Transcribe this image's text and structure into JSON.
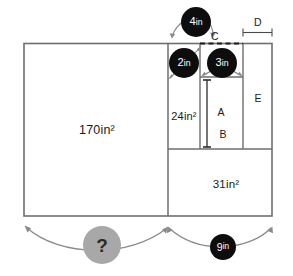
{
  "diagram": {
    "kind": "composite-rectangle-area-puzzle",
    "outer_rect": {
      "x": 24,
      "y": 43,
      "width": 248,
      "height": 173
    },
    "regions": [
      {
        "name": "left-region",
        "label": "170in²",
        "area_value": 170,
        "unit": "in²",
        "cx": 97,
        "cy": 130
      },
      {
        "name": "upper-middle-region",
        "label": "24in²",
        "area_value": 24,
        "unit": "in²",
        "cx": 184,
        "cy": 116
      },
      {
        "name": "lower-right-region",
        "label": "31in²",
        "area_value": 31,
        "unit": "in²",
        "cx": 226,
        "cy": 184
      },
      {
        "name": "segment-a",
        "label": "A",
        "cx": 221,
        "cy": 112
      },
      {
        "name": "segment-b",
        "label": "B",
        "cx": 223,
        "cy": 134
      },
      {
        "name": "segment-e",
        "label": "E",
        "cx": 258,
        "cy": 98
      }
    ],
    "dimension_labels": [
      {
        "name": "label-c",
        "label": "C",
        "cx": 215,
        "cy": 36
      },
      {
        "name": "label-d",
        "label": "D",
        "cx": 258,
        "cy": 22
      }
    ],
    "badges": [
      {
        "name": "badge-4in",
        "text_num": "4",
        "text_unit": "in",
        "color": "#0d0d0d",
        "cx": 196,
        "cy": 22,
        "size": "md"
      },
      {
        "name": "badge-2in",
        "text_num": "2",
        "text_unit": "in",
        "color": "#0d0d0d",
        "cx": 184,
        "cy": 63,
        "size": "md"
      },
      {
        "name": "badge-3in",
        "text_num": "3",
        "text_unit": "in",
        "color": "#0d0d0d",
        "cx": 222,
        "cy": 63,
        "size": "md"
      },
      {
        "name": "badge-9in",
        "text_num": "9",
        "text_unit": "in",
        "color": "#0d0d0d",
        "cx": 223,
        "cy": 247,
        "size": "sm"
      },
      {
        "name": "badge-question",
        "text_num": "?",
        "text_unit": "",
        "color": "#a8a8a8",
        "cx": 102,
        "cy": 245,
        "size": "q"
      }
    ],
    "colors": {
      "line": "#6e6e6e",
      "line_dark": "#3a3a3a",
      "badge_dark": "#0d0d0d",
      "badge_gray": "#a8a8a8",
      "text": "#1a1a1a",
      "background": "#ffffff"
    }
  }
}
